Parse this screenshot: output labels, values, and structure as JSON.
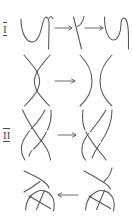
{
  "figure": {
    "background_color": "#ffffff",
    "ink_color": "#555555",
    "width": 132,
    "height": 216,
    "rows": [
      {
        "numeral": "I",
        "name": "reidemeister-move-1",
        "description": "A wavy strand with a kink is straightened; three curve panels linked by two rightward arrows.",
        "arrows": [
          {
            "name": "arrow-1",
            "direction": "right",
            "glyph": "→"
          },
          {
            "name": "arrow-2",
            "direction": "right",
            "glyph": "→"
          }
        ],
        "panels": [
          "curve-with-kink-left",
          "crossed-strand-middle",
          "smooth-wave-right"
        ]
      },
      {
        "numeral": "II",
        "name": "reidemeister-move-2",
        "description": "Two strands overlapping in a lens-shaped double crossing become two separated arcs.",
        "arrows": [
          {
            "name": "arrow-1",
            "direction": "right",
            "glyph": "→"
          }
        ],
        "panels": [
          "lens-double-crossing-left",
          "separated-arcs-right"
        ]
      },
      {
        "numeral": "III",
        "name": "reidemeister-move-3",
        "description": "Three braided strands slide one strand across the crossing of the other two.",
        "arrows": [
          {
            "name": "arrow-1",
            "direction": "right",
            "glyph": "→"
          }
        ],
        "panels": [
          "three-strand-braid-left",
          "three-strand-braid-right"
        ]
      },
      {
        "numeral": "IV",
        "name": "reidemeister-move-4",
        "description": "A strand is slid over a vertex/crossing; arrow points leftward between the two panels.",
        "arrows": [
          {
            "name": "arrow-1",
            "direction": "left",
            "glyph": "←"
          }
        ],
        "panels": [
          "strand-over-vertex-left",
          "strand-over-vertex-right"
        ]
      }
    ]
  }
}
